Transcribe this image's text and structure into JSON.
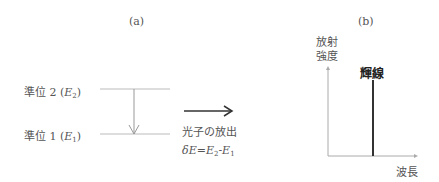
{
  "panel_a": {
    "label": "(a)",
    "level2": {
      "prefix": "準位 2 (",
      "var": "E",
      "sub": "2",
      "suffix": ")"
    },
    "level1": {
      "prefix": "準位 1 (",
      "var": "E",
      "sub": "1",
      "suffix": ")"
    },
    "emission_label": "光子の放出",
    "energy_formula": {
      "delta": "δ",
      "lhs": "E",
      "eq": "=",
      "e2": "E",
      "s2": "2",
      "minus": "-",
      "e1": "E",
      "s1": "1"
    }
  },
  "panel_b": {
    "label": "(b)",
    "y_axis_label_line1": "放射",
    "y_axis_label_line2": "強度",
    "x_axis_label": "波長",
    "line_label": "輝線"
  },
  "colors": {
    "level_line": "#bbbbbb",
    "axis": "#aaaaaa",
    "arrow": "#333333",
    "spectral_line": "#333333"
  }
}
